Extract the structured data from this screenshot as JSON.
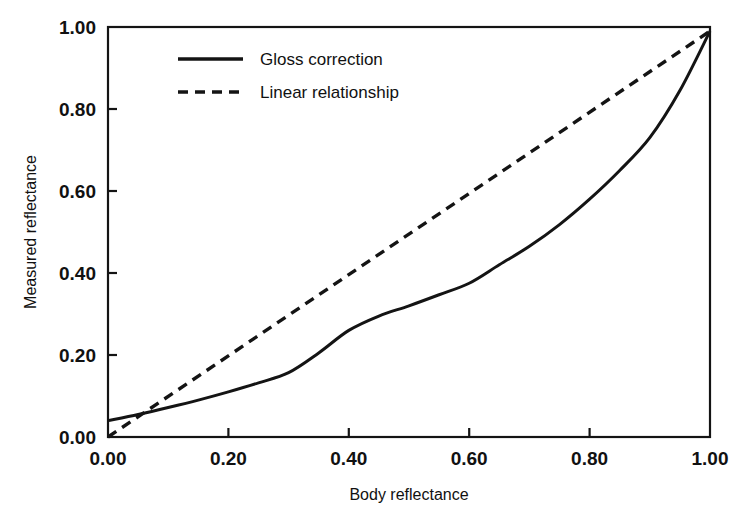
{
  "chart_data": {
    "type": "line",
    "title": "",
    "xlabel": "Body reflectance",
    "ylabel": "Measured reflectance",
    "xlim": [
      0.0,
      1.0
    ],
    "ylim": [
      0.0,
      1.0
    ],
    "xticks": [
      "0.00",
      "0.20",
      "0.40",
      "0.60",
      "0.80",
      "1.00"
    ],
    "yticks": [
      "0.00",
      "0.20",
      "0.40",
      "0.60",
      "0.80",
      "1.00"
    ],
    "xtick_values": [
      0.0,
      0.2,
      0.4,
      0.6,
      0.8,
      1.0
    ],
    "ytick_values": [
      0.0,
      0.2,
      0.4,
      0.6,
      0.8,
      1.0
    ],
    "grid": false,
    "legend_position": "upper-left-inside",
    "frame": "box",
    "tick_direction": "in",
    "series": [
      {
        "name": "Gloss correction",
        "style": "solid",
        "color": "#141414",
        "x": [
          0.0,
          0.05,
          0.1,
          0.15,
          0.2,
          0.25,
          0.3,
          0.35,
          0.4,
          0.45,
          0.5,
          0.55,
          0.6,
          0.65,
          0.7,
          0.75,
          0.8,
          0.85,
          0.9,
          0.95,
          1.0
        ],
        "y": [
          0.04,
          0.055,
          0.072,
          0.09,
          0.11,
          0.132,
          0.157,
          0.205,
          0.26,
          0.295,
          0.32,
          0.347,
          0.375,
          0.42,
          0.465,
          0.518,
          0.58,
          0.65,
          0.73,
          0.845,
          0.99
        ]
      },
      {
        "name": "Linear relationship",
        "style": "dashed",
        "color": "#141414",
        "x": [
          0.0,
          1.0
        ],
        "y": [
          0.0,
          0.99
        ]
      }
    ],
    "annotations": []
  },
  "legend": {
    "entries": [
      {
        "label": "Gloss correction",
        "style": "solid"
      },
      {
        "label": "Linear relationship",
        "style": "dashed"
      }
    ]
  },
  "axes": {
    "x_title": "Body reflectance",
    "y_title": "Measured reflectance",
    "x_tick_labels": [
      "0.00",
      "0.20",
      "0.40",
      "0.60",
      "0.80",
      "1.00"
    ],
    "y_tick_labels": [
      "0.00",
      "0.20",
      "0.40",
      "0.60",
      "0.80",
      "1.00"
    ]
  },
  "colors": {
    "ink": "#141414",
    "background": "#ffffff"
  }
}
